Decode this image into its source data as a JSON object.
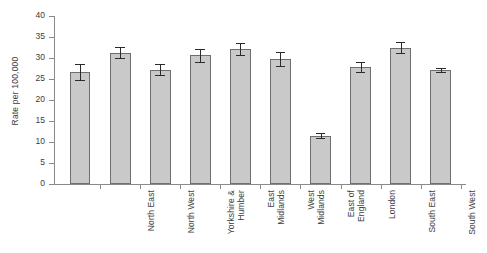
{
  "chart_data": {
    "type": "bar",
    "title": "",
    "subtitle": "",
    "xlabel": "",
    "ylabel": "Rate per 100,000",
    "ylim": [
      0,
      40
    ],
    "ytick_step": 5,
    "yticks": [
      0,
      5,
      10,
      15,
      20,
      25,
      30,
      35,
      40
    ],
    "ytick_labels": [
      "0",
      "5",
      "10",
      "15",
      "20",
      "25",
      "30",
      "35",
      "40"
    ],
    "grid": false,
    "legend": null,
    "error_bars": "95% confidence interval",
    "categories": [
      "North East",
      "North West",
      "Yorkshire &\nHumber",
      "East\nMidlands",
      "West\nMidlands",
      "East of\nEngland",
      "London",
      "South East",
      "South West",
      "England"
    ],
    "values": [
      26.6,
      31.3,
      27.2,
      30.6,
      32.1,
      29.8,
      11.5,
      27.9,
      32.5,
      27.1
    ],
    "error_low": [
      24.7,
      29.9,
      25.9,
      29.0,
      30.6,
      28.1,
      11.0,
      26.7,
      31.1,
      26.7
    ],
    "error_high": [
      28.6,
      32.7,
      28.6,
      32.1,
      33.6,
      31.4,
      12.1,
      29.1,
      33.9,
      27.6
    ],
    "colors": {
      "bar_fill": "#c9c9c9",
      "bar_border": "#6e6e6e",
      "error_bar": "#2b2b2b",
      "axis": "#8a8a8a",
      "text": "#3d3d3d",
      "background": "#ffffff"
    }
  }
}
